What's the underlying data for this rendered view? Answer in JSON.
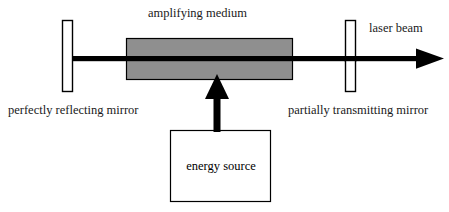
{
  "diagram": {
    "background_color": "#ffffff",
    "stroke_color": "#000000",
    "medium_fill_color": "#8f8f8f",
    "labels": {
      "amplifying_medium": "amplifying medium",
      "laser_beam": "laser beam",
      "perfectly_reflecting_mirror": "perfectly reflecting mirror",
      "partially_transmitting_mirror": "partially transmitting mirror",
      "energy_source": "energy source"
    },
    "components": [
      {
        "name": "left-mirror",
        "label": "perfectly reflecting mirror",
        "shape": "rectangle",
        "fill": "#ffffff",
        "stroke": "#000000"
      },
      {
        "name": "amplifying-medium",
        "label": "amplifying medium",
        "shape": "rectangle",
        "fill": "#8f8f8f",
        "stroke": "#000000"
      },
      {
        "name": "right-mirror",
        "label": "partially transmitting mirror",
        "shape": "rectangle",
        "fill": "#ffffff",
        "stroke": "#000000"
      },
      {
        "name": "energy-source",
        "label": "energy source",
        "shape": "rectangle",
        "fill": "#ffffff",
        "stroke": "#000000"
      },
      {
        "name": "laser-beam",
        "label": "laser beam",
        "shape": "horizontal-arrow",
        "fill": "#000000",
        "direction": "right"
      },
      {
        "name": "pump-arrow",
        "label": "",
        "shape": "vertical-arrow",
        "fill": "#000000",
        "direction": "up"
      }
    ]
  }
}
